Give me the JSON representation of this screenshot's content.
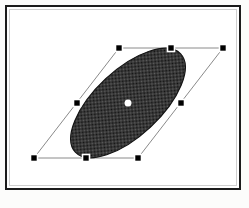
{
  "app": {
    "title": "Shape Selection Canvas",
    "caption": ""
  },
  "canvas": {
    "background_color": "#ffffff",
    "frame_color": "#1c1c1c",
    "inner_rule_color": "#cfcfcf",
    "width": 236,
    "height": 185
  },
  "shape": {
    "name": "ellipse",
    "fill_pattern": "50-percent-dither",
    "fill_color_dark": "#1a1a1a",
    "fill_color_light": "#6e6e6e",
    "outline_color": "#141414",
    "center_x": 127,
    "center_y": 102,
    "radius_x": 72,
    "radius_y": 33,
    "rotation_deg": -43,
    "shear_deg": 0
  },
  "selection": {
    "label": "Selected object",
    "outline_color": "#8a8a8a",
    "handle_fill": "#000000",
    "handle_stroke": "#ffffff",
    "handle_size": 7,
    "anchor_color": "#ffffff",
    "anchor_radius": 3.5,
    "bbox_corners": [
      {
        "name": "top-left",
        "x": 118,
        "y": 47
      },
      {
        "name": "top-right",
        "x": 222,
        "y": 47
      },
      {
        "name": "bottom-right",
        "x": 137,
        "y": 157
      },
      {
        "name": "bottom-left",
        "x": 33,
        "y": 157
      }
    ],
    "handles": [
      {
        "name": "handle-top-left",
        "x": 118,
        "y": 47
      },
      {
        "name": "handle-top-center",
        "x": 170,
        "y": 47
      },
      {
        "name": "handle-top-right",
        "x": 222,
        "y": 47
      },
      {
        "name": "handle-middle-left",
        "x": 76,
        "y": 102
      },
      {
        "name": "handle-middle-right",
        "x": 180,
        "y": 102
      },
      {
        "name": "handle-bottom-left",
        "x": 33,
        "y": 157
      },
      {
        "name": "handle-bottom-center",
        "x": 85,
        "y": 157
      },
      {
        "name": "handle-bottom-right",
        "x": 137,
        "y": 157
      }
    ],
    "anchor": {
      "name": "center-anchor",
      "x": 127,
      "y": 102
    }
  }
}
